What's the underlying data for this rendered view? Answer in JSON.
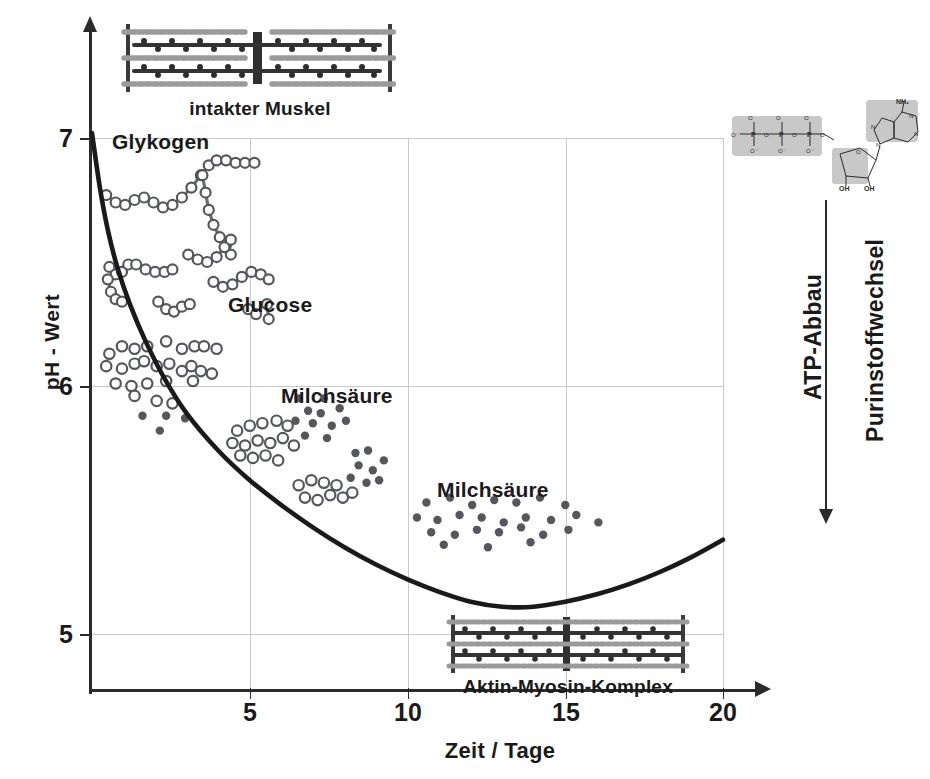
{
  "figure": {
    "axis_title_y": "pH - Wert",
    "axis_title_x": "Zeit / Tage",
    "y_ticks": [
      "7",
      "6",
      "5"
    ],
    "x_ticks": [
      "5",
      "10",
      "15",
      "20"
    ]
  },
  "annotations": {
    "intact_muscle": "intakter Muskel",
    "actin_myosin": "Aktin-Myosin-Komplex",
    "glycogen": "Glykogen",
    "glucose": "Glucose",
    "lactic_acid_1": "Milchsäure",
    "lactic_acid_2": "Milchsäure",
    "atp_breakdown": "ATP-Abbau",
    "purine_metabolism": "Purinstoffwechsel"
  },
  "molecule": {
    "nh2": "NH",
    "nh2_sub": "2",
    "oh_left": "OH",
    "oh_right": "OH",
    "n_labels": [
      "N",
      "N",
      "N",
      "N"
    ],
    "p_labels": [
      "P",
      "P",
      "P"
    ],
    "o_label": "O",
    "o_minus": "O⁻"
  },
  "colors": {
    "curve": "#1a1a1a",
    "axis": "#2b2b2b",
    "grid": "#c9c9c9",
    "open_marker_stroke": "#55575c",
    "open_marker_fill": "#ffffff",
    "filled_marker": "#55575c",
    "glycogen_marker": "#6b6d72",
    "molecule_box": "#c8c8c8",
    "muscle_dark": "#3a3a3a",
    "muscle_mid": "#8a8a8a"
  },
  "chart_data": {
    "type": "scatter",
    "title": "",
    "xlabel": "Zeit / Tage",
    "ylabel": "pH - Wert",
    "xlim": [
      0,
      20
    ],
    "ylim": [
      4.7,
      7.15
    ],
    "grid": true,
    "legend_position": "inline-annotations",
    "ph_curve": {
      "name": "pH - Wert",
      "style": "solid-thick-black",
      "points": [
        [
          0.0,
          7.02
        ],
        [
          0.25,
          6.8
        ],
        [
          0.5,
          6.63
        ],
        [
          0.8,
          6.48
        ],
        [
          1.2,
          6.33
        ],
        [
          1.7,
          6.18
        ],
        [
          2.3,
          6.03
        ],
        [
          3.0,
          5.89
        ],
        [
          4.0,
          5.74
        ],
        [
          5.0,
          5.62
        ],
        [
          6.0,
          5.52
        ],
        [
          7.0,
          5.43
        ],
        [
          8.0,
          5.35
        ],
        [
          9.0,
          5.28
        ],
        [
          10.0,
          5.22
        ],
        [
          11.0,
          5.17
        ],
        [
          12.0,
          5.13
        ],
        [
          13.0,
          5.11
        ],
        [
          14.0,
          5.11
        ],
        [
          15.0,
          5.13
        ],
        [
          16.0,
          5.16
        ],
        [
          17.0,
          5.2
        ],
        [
          18.0,
          5.25
        ],
        [
          19.0,
          5.31
        ],
        [
          20.0,
          5.38
        ]
      ]
    },
    "series": [
      {
        "name": "Glykogen",
        "marker": "chain-of-open-circles",
        "description": "Glycogen chains progressively fragmenting over time",
        "chains": [
          [
            [
              0.45,
              6.77
            ],
            [
              0.75,
              6.74
            ],
            [
              1.05,
              6.73
            ],
            [
              1.35,
              6.75
            ],
            [
              1.65,
              6.76
            ],
            [
              1.95,
              6.74
            ],
            [
              2.25,
              6.72
            ],
            [
              2.55,
              6.73
            ],
            [
              2.85,
              6.76
            ],
            [
              3.15,
              6.8
            ],
            [
              3.45,
              6.85
            ],
            [
              3.7,
              6.89
            ],
            [
              3.95,
              6.91
            ],
            [
              4.25,
              6.91
            ],
            [
              4.55,
              6.9
            ],
            [
              4.85,
              6.9
            ],
            [
              5.15,
              6.9
            ]
          ],
          [
            [
              3.5,
              6.85
            ],
            [
              3.6,
              6.78
            ],
            [
              3.7,
              6.71
            ],
            [
              3.85,
              6.65
            ],
            [
              4.05,
              6.6
            ],
            [
              4.25,
              6.57
            ],
            [
              4.4,
              6.53
            ]
          ],
          [
            [
              0.55,
              6.48
            ],
            [
              0.75,
              6.45
            ],
            [
              0.95,
              6.46
            ],
            [
              1.15,
              6.49
            ],
            [
              1.4,
              6.49
            ],
            [
              1.7,
              6.47
            ],
            [
              2.0,
              6.46
            ],
            [
              2.3,
              6.46
            ],
            [
              2.55,
              6.47
            ]
          ],
          [
            [
              0.5,
              6.43
            ],
            [
              0.6,
              6.38
            ],
            [
              0.75,
              6.35
            ],
            [
              0.95,
              6.34
            ]
          ],
          [
            [
              3.05,
              6.53
            ],
            [
              3.35,
              6.51
            ],
            [
              3.65,
              6.5
            ],
            [
              3.95,
              6.52
            ],
            [
              4.2,
              6.56
            ],
            [
              4.4,
              6.59
            ]
          ],
          [
            [
              3.85,
              6.42
            ],
            [
              4.15,
              6.4
            ],
            [
              4.45,
              6.41
            ],
            [
              4.75,
              6.44
            ],
            [
              5.05,
              6.46
            ],
            [
              5.35,
              6.45
            ],
            [
              5.6,
              6.43
            ]
          ],
          [
            [
              2.1,
              6.34
            ],
            [
              2.35,
              6.31
            ],
            [
              2.6,
              6.3
            ],
            [
              2.85,
              6.32
            ],
            [
              3.1,
              6.33
            ]
          ],
          [
            [
              4.95,
              6.31
            ],
            [
              5.2,
              6.29
            ]
          ],
          [
            [
              5.55,
              6.33
            ],
            [
              5.6,
              6.27
            ]
          ]
        ]
      },
      {
        "name": "Glucose",
        "marker": "open-circle",
        "description": "Free glucose released from glycogen breakdown",
        "points": [
          [
            0.55,
            6.13
          ],
          [
            0.95,
            6.16
          ],
          [
            1.35,
            6.15
          ],
          [
            1.75,
            6.16
          ],
          [
            2.35,
            6.18
          ],
          [
            2.85,
            6.15
          ],
          [
            3.25,
            6.16
          ],
          [
            3.55,
            6.16
          ],
          [
            3.95,
            6.15
          ],
          [
            0.45,
            6.08
          ],
          [
            0.95,
            6.07
          ],
          [
            1.35,
            6.09
          ],
          [
            1.65,
            6.1
          ],
          [
            2.05,
            6.08
          ],
          [
            2.45,
            6.09
          ],
          [
            2.85,
            6.06
          ],
          [
            3.15,
            6.08
          ],
          [
            3.45,
            6.06
          ],
          [
            3.8,
            6.05
          ],
          [
            0.75,
            6.01
          ],
          [
            1.25,
            6.0
          ],
          [
            1.75,
            6.01
          ],
          [
            2.35,
            6.02
          ],
          [
            3.2,
            6.02
          ],
          [
            2.05,
            5.94
          ],
          [
            1.35,
            5.96
          ],
          [
            2.55,
            5.93
          ],
          [
            4.6,
            5.82
          ],
          [
            5.0,
            5.84
          ],
          [
            5.4,
            5.85
          ],
          [
            5.85,
            5.86
          ],
          [
            6.2,
            5.84
          ],
          [
            4.45,
            5.77
          ],
          [
            4.85,
            5.76
          ],
          [
            5.25,
            5.78
          ],
          [
            5.65,
            5.77
          ],
          [
            6.05,
            5.79
          ],
          [
            6.4,
            5.76
          ],
          [
            4.7,
            5.72
          ],
          [
            5.1,
            5.71
          ],
          [
            5.5,
            5.72
          ],
          [
            5.9,
            5.7
          ],
          [
            6.55,
            5.6
          ],
          [
            6.95,
            5.62
          ],
          [
            7.35,
            5.61
          ],
          [
            7.75,
            5.6
          ],
          [
            6.75,
            5.55
          ],
          [
            7.15,
            5.54
          ],
          [
            7.55,
            5.56
          ],
          [
            7.95,
            5.55
          ],
          [
            8.25,
            5.57
          ]
        ]
      },
      {
        "name": "Milchsäure",
        "marker": "filled-circle",
        "description": "Lactic acid accumulating as glycolysis proceeds",
        "points": [
          [
            1.6,
            5.88
          ],
          [
            2.35,
            5.88
          ],
          [
            2.95,
            5.87
          ],
          [
            2.15,
            5.82
          ],
          [
            6.55,
            5.95
          ],
          [
            7.35,
            5.95
          ],
          [
            6.85,
            5.9
          ],
          [
            7.25,
            5.89
          ],
          [
            7.85,
            5.91
          ],
          [
            6.45,
            5.86
          ],
          [
            7.0,
            5.85
          ],
          [
            7.6,
            5.84
          ],
          [
            8.05,
            5.86
          ],
          [
            6.75,
            5.8
          ],
          [
            7.45,
            5.79
          ],
          [
            8.35,
            5.73
          ],
          [
            8.75,
            5.74
          ],
          [
            8.45,
            5.68
          ],
          [
            8.9,
            5.66
          ],
          [
            9.25,
            5.7
          ],
          [
            8.2,
            5.63
          ],
          [
            8.7,
            5.61
          ],
          [
            9.1,
            5.62
          ],
          [
            10.6,
            5.53
          ],
          [
            11.35,
            5.55
          ],
          [
            12.05,
            5.52
          ],
          [
            12.75,
            5.54
          ],
          [
            13.45,
            5.53
          ],
          [
            14.2,
            5.55
          ],
          [
            15.0,
            5.52
          ],
          [
            10.3,
            5.47
          ],
          [
            10.95,
            5.46
          ],
          [
            11.65,
            5.48
          ],
          [
            12.35,
            5.47
          ],
          [
            13.05,
            5.45
          ],
          [
            13.75,
            5.47
          ],
          [
            14.55,
            5.46
          ],
          [
            15.35,
            5.48
          ],
          [
            16.05,
            5.45
          ],
          [
            10.75,
            5.41
          ],
          [
            11.5,
            5.4
          ],
          [
            12.2,
            5.42
          ],
          [
            12.9,
            5.41
          ],
          [
            13.6,
            5.43
          ],
          [
            14.3,
            5.4
          ],
          [
            15.1,
            5.42
          ],
          [
            11.15,
            5.36
          ],
          [
            12.55,
            5.35
          ],
          [
            13.9,
            5.37
          ]
        ]
      }
    ]
  }
}
